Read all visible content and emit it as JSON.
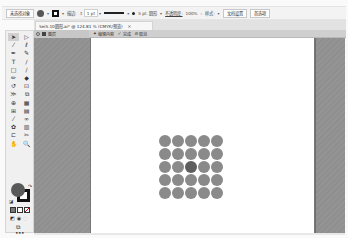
{
  "control_bar": {
    "selection_label": "未选择对象",
    "stroke_label": "描边:",
    "stroke_value": "1 pt",
    "brush_label": "5 pt. 圆形",
    "opacity_label": "不透明度:",
    "opacity_value": "100%",
    "style_label": "样式:",
    "doc_settings_button": "文档设置",
    "preferences_button": "首选项",
    "fill_color": "#555555",
    "stroke_color": "#111111"
  },
  "document_tab": {
    "title": "Sei5.10圆形.ai* @ 124.81 % (CMYK/预览)",
    "close": "×"
  },
  "isolation_bar": {
    "back_icon": "back-arrow-icon",
    "layer_label": "图层",
    "edit_label": "编辑内容",
    "done_label": "完成",
    "cancel_label": "取消"
  },
  "toolbox": {
    "tools": [
      {
        "name": "selection-tool",
        "glyph": "➤",
        "active": true
      },
      {
        "name": "direct-selection-tool",
        "glyph": "▷"
      },
      {
        "name": "magic-wand-tool",
        "glyph": "⁄"
      },
      {
        "name": "lasso-tool",
        "glyph": "ℓ"
      },
      {
        "name": "pen-tool",
        "glyph": "✒"
      },
      {
        "name": "curvature-tool",
        "glyph": "✎"
      },
      {
        "name": "type-tool",
        "glyph": "T"
      },
      {
        "name": "line-tool",
        "glyph": "/"
      },
      {
        "name": "rectangle-tool",
        "glyph": "□"
      },
      {
        "name": "paintbrush-tool",
        "glyph": "∕"
      },
      {
        "name": "pencil-tool",
        "glyph": "✏"
      },
      {
        "name": "shaper-tool",
        "glyph": "◆"
      },
      {
        "name": "rotate-tool",
        "glyph": "↺"
      },
      {
        "name": "scale-tool",
        "glyph": "⊡"
      },
      {
        "name": "width-tool",
        "glyph": "≫"
      },
      {
        "name": "free-transform-tool",
        "glyph": "⧉"
      },
      {
        "name": "shape-builder-tool",
        "glyph": "⊕"
      },
      {
        "name": "perspective-grid-tool",
        "glyph": "▦"
      },
      {
        "name": "mesh-tool",
        "glyph": "⊞"
      },
      {
        "name": "gradient-tool",
        "glyph": "▤"
      },
      {
        "name": "eyedropper-tool",
        "glyph": "⁄"
      },
      {
        "name": "blend-tool",
        "glyph": "∞"
      },
      {
        "name": "symbol-sprayer-tool",
        "glyph": "✿"
      },
      {
        "name": "column-graph-tool",
        "glyph": "▥"
      },
      {
        "name": "artboard-tool",
        "glyph": "⊏"
      },
      {
        "name": "slice-tool",
        "glyph": "✂"
      },
      {
        "name": "hand-tool",
        "glyph": "✋"
      },
      {
        "name": "zoom-tool",
        "glyph": "🔍"
      }
    ],
    "more_label": "•••",
    "fill_color": "#595959",
    "stroke_color": "#111111"
  },
  "canvas": {
    "artboard_color": "#ffffff",
    "dot_color": "#8a8a8a",
    "center_dot_color": "#5e5e5e",
    "grid_rows": 5,
    "grid_cols": 5
  }
}
